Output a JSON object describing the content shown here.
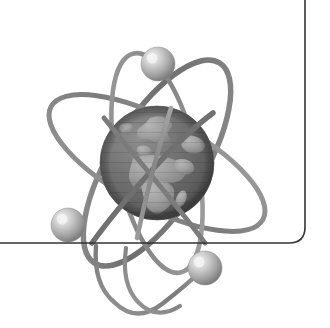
{
  "image": {
    "title": "Atom with Earth globe nucleus",
    "subject": "science-technology-globe-emblem",
    "style": "grayscale-halftone-clipart",
    "width": 330,
    "height": 328,
    "background_color": "#ffffff"
  },
  "palette": {
    "background": "#ffffff",
    "border_line": "#333333",
    "orbit_dark": "#6f6f6f",
    "orbit_mid": "#8a8a8a",
    "orbit_light": "#a8a8a8",
    "globe_ocean_dark": "#5d5d5d",
    "globe_ocean": "#6d6d6d",
    "globe_ocean_light": "#7d7d7d",
    "globe_land": "#9b9b9b",
    "globe_land_light": "#adadad",
    "globe_shadow": "#4a4a4a",
    "electron_base": "#8e8e8e",
    "electron_mid": "#b4b4b4",
    "electron_highlight": "#ededed"
  },
  "border": {
    "name": "page-frame-rule",
    "color": "#333333",
    "stroke_width": 1.6,
    "vertical_x": 305,
    "vertical_top_y": 0,
    "horizontal_y": 243,
    "horizontal_left_x": 0,
    "corner_radius": 16
  },
  "globe": {
    "name": "earth-globe-nucleus",
    "center_x": 157,
    "center_y": 163,
    "radius": 57,
    "landmasses": [
      "Europe",
      "Africa",
      "Asia-west",
      "Greenland-edge"
    ],
    "highlight_position": "upper-left",
    "shadow_position": "lower-right"
  },
  "orbits": [
    {
      "name": "orbit-ring-1",
      "label": "upper-left to lower-right ellipse",
      "rx": 118,
      "ry": 46,
      "rotation_deg": -58,
      "stroke": "#7a7a7a",
      "stroke_width": 5.5
    },
    {
      "name": "orbit-ring-2",
      "label": "upper-right to lower-left ellipse",
      "rx": 120,
      "ry": 44,
      "rotation_deg": 28,
      "stroke": "#8a8a8a",
      "stroke_width": 5.0
    },
    {
      "name": "orbit-ring-3",
      "label": "steep vertical ellipse",
      "rx": 112,
      "ry": 40,
      "rotation_deg": 78,
      "stroke": "#909090",
      "stroke_width": 4.6
    }
  ],
  "electrons": [
    {
      "name": "electron-top",
      "cx": 158,
      "cy": 64,
      "r": 17,
      "orbit": "orbit-ring-1"
    },
    {
      "name": "electron-lower-left",
      "cx": 68,
      "cy": 225,
      "r": 17,
      "orbit": "orbit-ring-2"
    },
    {
      "name": "electron-lower-right",
      "cx": 205,
      "cy": 268,
      "r": 17,
      "orbit": "orbit-ring-3"
    }
  ],
  "accessibility": {
    "alt_text": "Grayscale illustration of an atom whose nucleus is the planet Earth, encircled by three elliptical electron orbits each carrying a small sphere, with a thin rounded frame rule at the right and bottom."
  }
}
